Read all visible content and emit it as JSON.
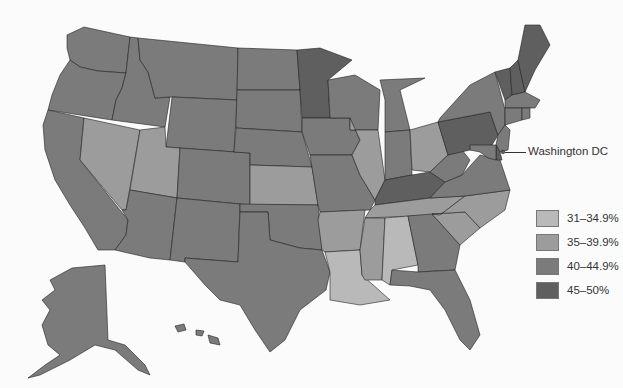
{
  "map": {
    "type": "choropleth",
    "region": "United States",
    "colors": {
      "c1": "#b9b9b9",
      "c2": "#9c9c9c",
      "c3": "#7b7b7b",
      "c4": "#5f5f5f"
    },
    "annotation": {
      "label": "Washington DC"
    }
  },
  "legend": {
    "items": [
      {
        "label": "31–34.9%",
        "color": "#b9b9b9"
      },
      {
        "label": "35–39.9%",
        "color": "#9c9c9c"
      },
      {
        "label": "40–44.9%",
        "color": "#7b7b7b"
      },
      {
        "label": "45–50%",
        "color": "#5f5f5f"
      }
    ]
  },
  "states": {
    "WA": "40–44.9%",
    "OR": "40–44.9%",
    "CA": "40–44.9%",
    "NV": "35–39.9%",
    "ID": "40–44.9%",
    "MT": "40–44.9%",
    "WY": "40–44.9%",
    "UT": "35–39.9%",
    "AZ": "40–44.9%",
    "CO": "40–44.9%",
    "NM": "40–44.9%",
    "ND": "40–44.9%",
    "SD": "40–44.9%",
    "NE": "40–44.9%",
    "KS": "35–39.9%",
    "OK": "40–44.9%",
    "TX": "40–44.9%",
    "MN": "45–50%",
    "IA": "40–44.9%",
    "MO": "40–44.9%",
    "AR": "35–39.9%",
    "LA": "31–34.9%",
    "WI": "40–44.9%",
    "IL": "35–39.9%",
    "MI": "40–44.9%",
    "IN": "40–44.9%",
    "OH": "35–39.9%",
    "KY": "45–50%",
    "TN": "35–39.9%",
    "MS": "35–39.9%",
    "AL": "31–34.9%",
    "GA": "40–44.9%",
    "FL": "40–44.9%",
    "SC": "35–39.9%",
    "NC": "35–39.9%",
    "VA": "40–44.9%",
    "WV": "40–44.9%",
    "PA": "45–50%",
    "NY": "40–44.9%",
    "VT": "45–50%",
    "NH": "45–50%",
    "ME": "45–50%",
    "MA": "40–44.9%",
    "CT": "40–44.9%",
    "RI": "40–44.9%",
    "NJ": "40–44.9%",
    "DE": "45–50%",
    "MD": "40–44.9%",
    "DC": "45–50%",
    "AK": "40–44.9%",
    "HI": "40–44.9%"
  }
}
